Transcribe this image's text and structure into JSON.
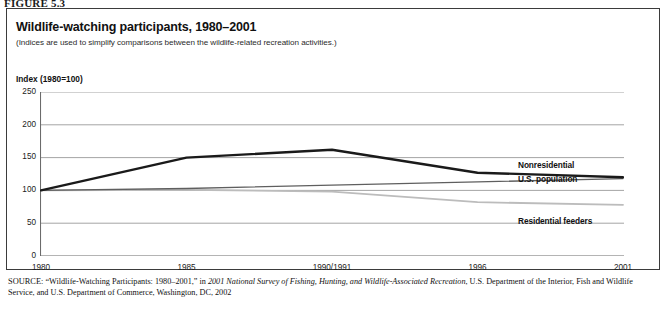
{
  "figure": {
    "label": "FIGURE 5.3"
  },
  "header": {
    "title": "Wildlife-watching participants, 1980–2001",
    "subtitle": "(Indices are used to simplify comparisons between the wildlife-related recreation activities.)",
    "axis_note": "Index (1980=100)"
  },
  "source": {
    "prefix": "SOURCE:",
    "part1": " “Wildlife-Watching Participants: 1980–2001,” in ",
    "italic1": "2001 National Survey of Fishing, Hunting, and Wildlife-Associated Recreation",
    "part2": ", U.S. Department of the Interior, Fish and Wildlife Service, and U.S. Department of Commerce, Washington, DC, 2002"
  },
  "colors": {
    "nonresidential": "#1a1a1a",
    "us_population": "#5f5f5f",
    "residential_feeders": "#bcbcbc",
    "gridline": "#9a9a9a",
    "axis": "#6b6b6b",
    "frame": "#3b3b3b"
  },
  "chart_data": {
    "type": "line",
    "title": "Wildlife-watching participants, 1980–2001",
    "subtitle": "(Indices are used to simplify comparisons between the wildlife-related recreation activities.)",
    "xlabel": "",
    "ylabel": "Index (1980=100)",
    "categories": [
      "1980",
      "1985",
      "1990/1991",
      "1996",
      "2001"
    ],
    "ytick_labels": [
      "0",
      "50",
      "100",
      "150",
      "200",
      "250"
    ],
    "yticks": [
      0,
      50,
      100,
      150,
      200,
      250
    ],
    "ylim": [
      0,
      250
    ],
    "grid": true,
    "legend": "inline-right-labels",
    "series": [
      {
        "name": "Nonresidential",
        "color": "#1a1a1a",
        "width": 2.4,
        "values": [
          100,
          150,
          162,
          127,
          120
        ]
      },
      {
        "name": "U.S. population",
        "color": "#5f5f5f",
        "width": 1.4,
        "values": [
          100,
          103,
          108,
          113,
          118
        ]
      },
      {
        "name": "Residential feeders",
        "color": "#bcbcbc",
        "width": 1.8,
        "values": [
          100,
          101,
          98,
          82,
          78
        ]
      }
    ],
    "annotations": [
      {
        "text": "Nonresidential",
        "series": "Nonresidential"
      },
      {
        "text": "U.S. population",
        "series": "U.S. population"
      },
      {
        "text": "Residential feeders",
        "series": "Residential feeders"
      }
    ]
  }
}
